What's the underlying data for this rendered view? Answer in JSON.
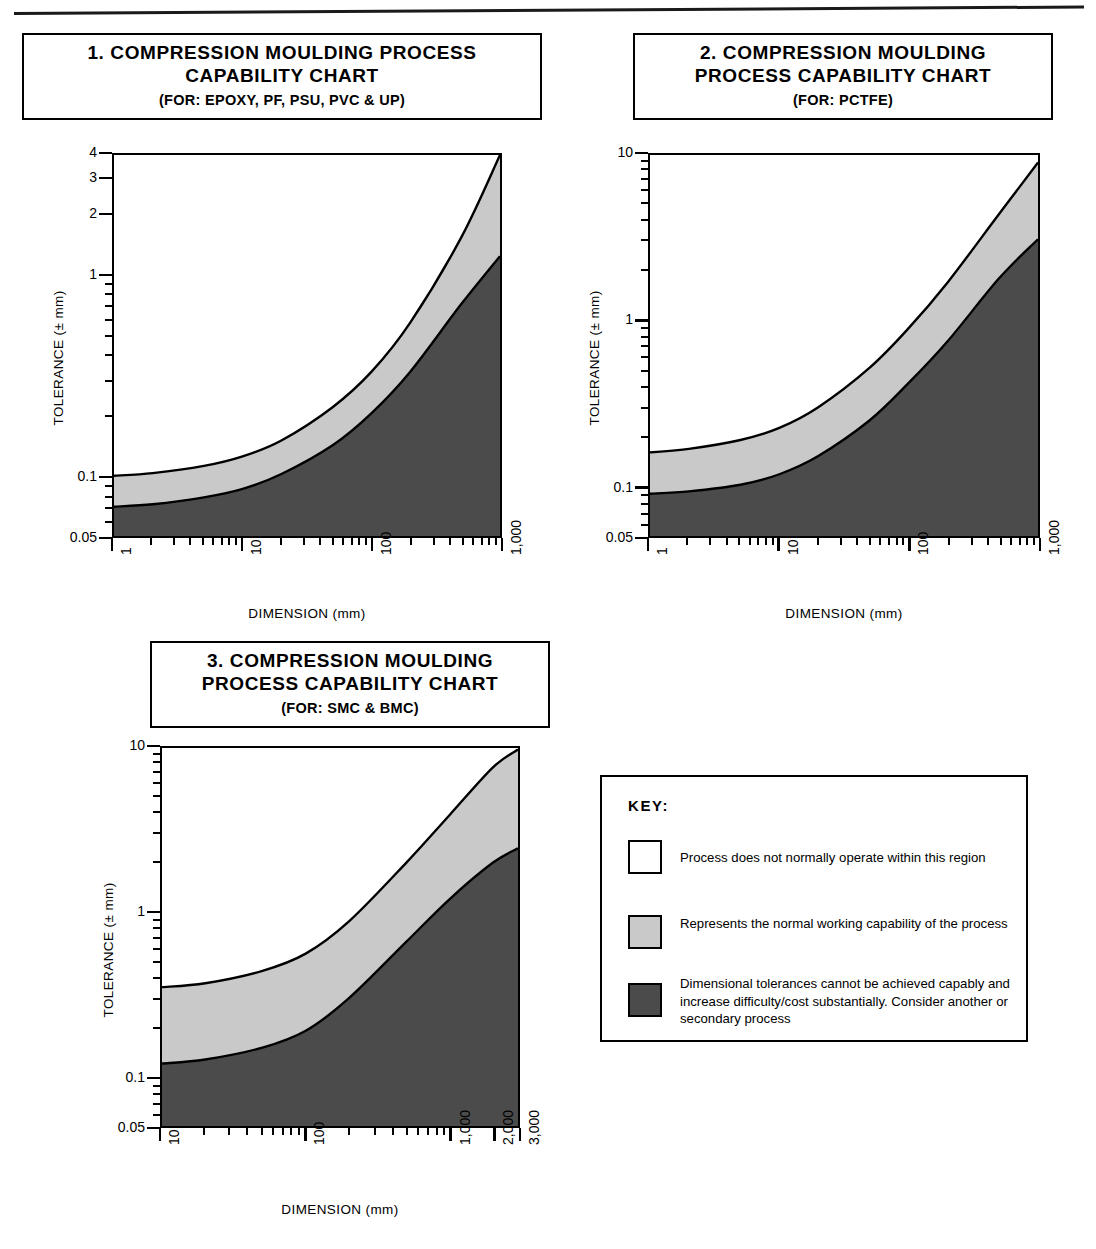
{
  "document": {
    "title": "Compression Moulding Process Capability Charts"
  },
  "charts": [
    {
      "number": "1.",
      "title": "1.  COMPRESSION MOULDING PROCESS\nCAPABILITY CHART",
      "subtitle": "(FOR: EPOXY, PF, PSU, PVC & UP)",
      "ylabel": "TOLERANCE (± mm)",
      "xlabel": "DIMENSION (mm)",
      "yticks": [
        "4",
        "3",
        "2",
        "1",
        "0.1",
        "0.05"
      ],
      "xticks": [
        "1",
        "10",
        "100",
        "1,000"
      ]
    },
    {
      "number": "2.",
      "title": "2.  COMPRESSION MOULDING\nPROCESS CAPABILITY CHART",
      "subtitle": "(FOR: PCTFE)",
      "ylabel": "TOLERANCE (± mm)",
      "xlabel": "DIMENSION (mm)",
      "yticks": [
        "10",
        "1",
        "0.1",
        "0.05"
      ],
      "xticks": [
        "1",
        "10",
        "100",
        "1,000"
      ]
    },
    {
      "number": "3.",
      "title": "3.  COMPRESSION MOULDING\nPROCESS CAPABILITY CHART",
      "subtitle": "(FOR: SMC & BMC)",
      "ylabel": "TOLERANCE (± mm)",
      "xlabel": "DIMENSION (mm)",
      "yticks": [
        "10",
        "1",
        "0.1",
        "0.05"
      ],
      "xticks": [
        "10",
        "100",
        "1,000",
        "2,000",
        "3,000"
      ]
    }
  ],
  "key": {
    "title": "KEY:",
    "items": [
      {
        "swatch": "white",
        "color": "#ffffff",
        "text": "Process does not normally operate within this region"
      },
      {
        "swatch": "light-grey",
        "color": "#c9c9c9",
        "text": "Represents the normal working capability of the process"
      },
      {
        "swatch": "dark-grey",
        "color": "#4b4b4b",
        "text": "Dimensional tolerances cannot be achieved capably and increase difficulty/cost substantially. Consider another or secondary process"
      }
    ]
  },
  "colors": {
    "white_region": "#ffffff",
    "light_grey_region": "#c9c9c9",
    "dark_grey_region": "#4b4b4b",
    "line": "#000000"
  },
  "chart_data": [
    {
      "type": "area",
      "title": "1. COMPRESSION MOULDING PROCESS CAPABILITY CHART (FOR: EPOXY, PF, PSU, PVC & UP)",
      "xlabel": "DIMENSION (mm)",
      "ylabel": "TOLERANCE (± mm)",
      "xscale": "log",
      "yscale": "log",
      "xlim": [
        1,
        1000
      ],
      "ylim": [
        0.05,
        4
      ],
      "xticks": [
        1,
        10,
        100,
        1000
      ],
      "xticklabels": [
        "1",
        "10",
        "100",
        "1,000"
      ],
      "yticks": [
        0.05,
        0.1,
        1,
        2,
        3,
        4
      ],
      "yticklabels": [
        "0.05",
        "0.1",
        "1",
        "2",
        "3",
        "4"
      ],
      "grid": false,
      "legend": "external-key",
      "series": [
        {
          "name": "upper boundary (top of normal working capability)",
          "x": [
            1,
            2,
            5,
            10,
            20,
            50,
            100,
            200,
            500,
            1000
          ],
          "y": [
            0.1,
            0.103,
            0.112,
            0.125,
            0.15,
            0.22,
            0.33,
            0.58,
            1.55,
            4.0
          ]
        },
        {
          "name": "lower boundary (top of difficult/costly region)",
          "x": [
            1,
            2,
            5,
            10,
            20,
            50,
            100,
            200,
            500,
            1000
          ],
          "y": [
            0.07,
            0.072,
            0.078,
            0.086,
            0.102,
            0.142,
            0.205,
            0.33,
            0.72,
            1.25
          ]
        }
      ],
      "bands": [
        {
          "name": "process does not normally operate",
          "fill": "#ffffff",
          "above": "upper boundary"
        },
        {
          "name": "normal working capability",
          "fill": "#c9c9c9",
          "between": [
            "upper boundary",
            "lower boundary"
          ]
        },
        {
          "name": "not capable / high cost",
          "fill": "#4b4b4b",
          "below": "lower boundary"
        }
      ]
    },
    {
      "type": "area",
      "title": "2. COMPRESSION MOULDING PROCESS CAPABILITY CHART (FOR: PCTFE)",
      "xlabel": "DIMENSION (mm)",
      "ylabel": "TOLERANCE (± mm)",
      "xscale": "log",
      "yscale": "log",
      "xlim": [
        1,
        1000
      ],
      "ylim": [
        0.05,
        10
      ],
      "xticks": [
        1,
        10,
        100,
        1000
      ],
      "xticklabels": [
        "1",
        "10",
        "100",
        "1,000"
      ],
      "yticks": [
        0.05,
        0.1,
        1,
        10
      ],
      "yticklabels": [
        "0.05",
        "0.1",
        "1",
        "10"
      ],
      "grid": false,
      "legend": "external-key",
      "series": [
        {
          "name": "upper boundary (top of normal working capability)",
          "x": [
            1,
            2,
            5,
            10,
            20,
            50,
            100,
            200,
            500,
            1000
          ],
          "y": [
            0.16,
            0.168,
            0.19,
            0.225,
            0.3,
            0.52,
            0.9,
            1.7,
            4.4,
            9.0
          ]
        },
        {
          "name": "lower boundary (top of difficult/costly region)",
          "x": [
            1,
            2,
            5,
            10,
            20,
            50,
            100,
            200,
            500,
            1000
          ],
          "y": [
            0.09,
            0.093,
            0.102,
            0.118,
            0.152,
            0.25,
            0.42,
            0.75,
            1.8,
            3.1
          ]
        }
      ],
      "bands": [
        {
          "name": "process does not normally operate",
          "fill": "#ffffff",
          "above": "upper boundary"
        },
        {
          "name": "normal working capability",
          "fill": "#c9c9c9",
          "between": [
            "upper boundary",
            "lower boundary"
          ]
        },
        {
          "name": "not capable / high cost",
          "fill": "#4b4b4b",
          "below": "lower boundary"
        }
      ]
    },
    {
      "type": "area",
      "title": "3. COMPRESSION MOULDING PROCESS CAPABILITY CHART (FOR: SMC & BMC)",
      "xlabel": "DIMENSION (mm)",
      "ylabel": "TOLERANCE (± mm)",
      "xscale": "log",
      "yscale": "log",
      "xlim": [
        10,
        3000
      ],
      "ylim": [
        0.05,
        10
      ],
      "xticks": [
        10,
        100,
        1000,
        2000,
        3000
      ],
      "xticklabels": [
        "10",
        "100",
        "1,000",
        "2,000",
        "3,000"
      ],
      "yticks": [
        0.05,
        0.1,
        1,
        10
      ],
      "yticklabels": [
        "0.05",
        "0.1",
        "1",
        "10"
      ],
      "grid": false,
      "legend": "external-key",
      "series": [
        {
          "name": "upper boundary (top of normal working capability)",
          "x": [
            10,
            20,
            50,
            100,
            200,
            500,
            1000,
            2000,
            3000
          ],
          "y": [
            0.35,
            0.37,
            0.44,
            0.56,
            0.88,
            2.0,
            3.9,
            7.6,
            9.8
          ]
        },
        {
          "name": "lower boundary (top of difficult/costly region)",
          "x": [
            10,
            20,
            50,
            100,
            200,
            500,
            1000,
            2000,
            3000
          ],
          "y": [
            0.12,
            0.127,
            0.15,
            0.19,
            0.3,
            0.66,
            1.2,
            2.0,
            2.45
          ]
        }
      ],
      "bands": [
        {
          "name": "process does not normally operate",
          "fill": "#ffffff",
          "above": "upper boundary"
        },
        {
          "name": "normal working capability",
          "fill": "#c9c9c9",
          "between": [
            "upper boundary",
            "lower boundary"
          ]
        },
        {
          "name": "not capable / high cost",
          "fill": "#4b4b4b",
          "below": "lower boundary"
        }
      ]
    }
  ]
}
